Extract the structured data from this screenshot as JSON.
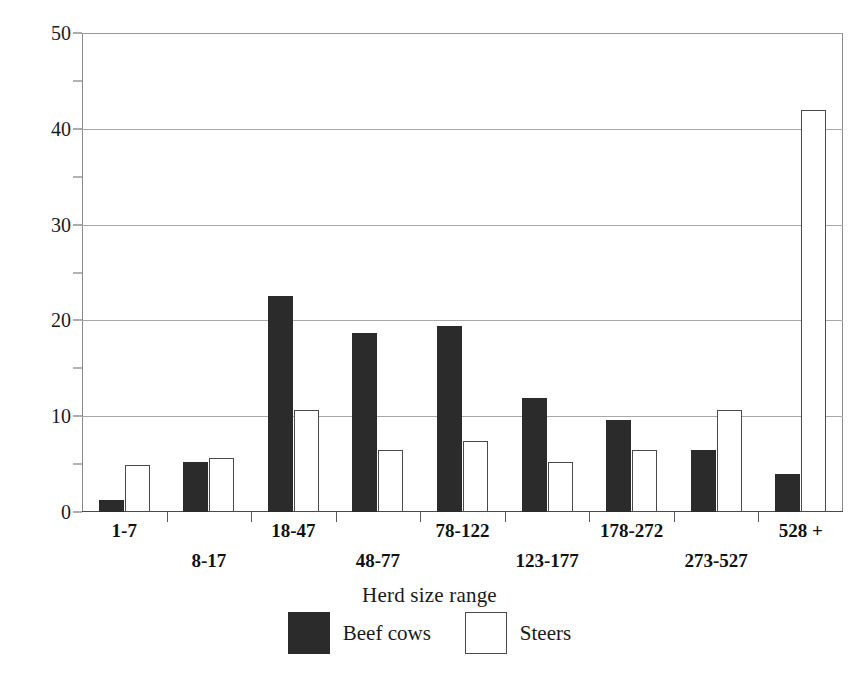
{
  "chart_data": {
    "type": "bar",
    "title": "",
    "xlabel": "Herd size range",
    "ylabel": "Percentage of total in size range",
    "categories": [
      "1-7",
      "8-17",
      "18-47",
      "48-77",
      "78-122",
      "123-177",
      "178-272",
      "273-527",
      "528 +"
    ],
    "series": [
      {
        "name": "Beef cows",
        "color": "#2b2b2b",
        "values": [
          1.3,
          5.2,
          22.6,
          18.7,
          19.4,
          11.9,
          9.6,
          6.5,
          4.0
        ]
      },
      {
        "name": "Steers",
        "color": "#ffffff",
        "values": [
          4.9,
          5.6,
          10.6,
          6.5,
          7.4,
          5.2,
          6.5,
          10.6,
          42.0
        ]
      }
    ],
    "ylim": [
      0,
      50
    ],
    "y_major_ticks": [
      0,
      10,
      20,
      30,
      40,
      50
    ],
    "y_minor_ticks": [
      5,
      15,
      25,
      35,
      45
    ],
    "y_tick_labels": [
      "0",
      "10",
      "20",
      "30",
      "40",
      "50"
    ],
    "grid": "horizontal-major-only",
    "legend_position": "bottom-center"
  },
  "legend": {
    "entries": [
      {
        "label": "Beef cows",
        "swatch": "filled-black-square"
      },
      {
        "label": "Steers",
        "swatch": "open-white-square"
      }
    ]
  }
}
